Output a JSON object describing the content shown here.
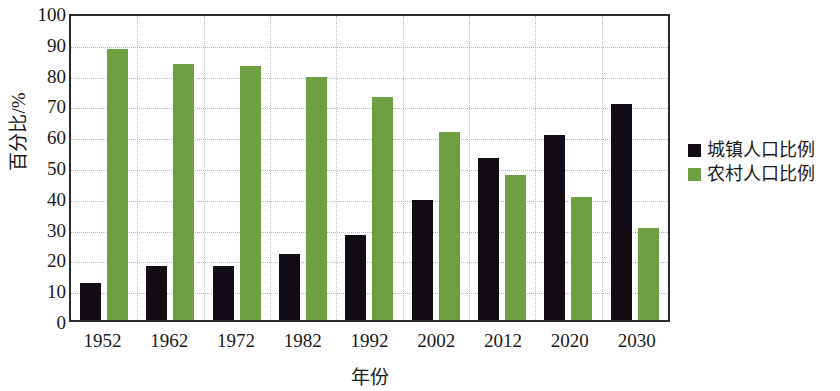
{
  "chart_data": {
    "type": "bar",
    "title": "",
    "xlabel": "年份",
    "ylabel": "百分比/%",
    "ylim": [
      0,
      100
    ],
    "ytick_step": 10,
    "yticks": [
      100,
      90,
      80,
      70,
      60,
      50,
      40,
      30,
      20,
      10,
      0
    ],
    "grid": true,
    "legend_position": "right",
    "categories": [
      "1952",
      "1962",
      "1972",
      "1982",
      "1992",
      "2002",
      "2012",
      "2020",
      "2030"
    ],
    "series": [
      {
        "name": "城镇人口比例",
        "color": "#120d14",
        "values": [
          12,
          17.5,
          17.5,
          21.5,
          27.5,
          39,
          52.5,
          60,
          70
        ]
      },
      {
        "name": "农村人口比例",
        "color": "#6ea042",
        "values": [
          88,
          83,
          82.5,
          79,
          72.5,
          61,
          47,
          40,
          30
        ]
      }
    ]
  },
  "legend": {
    "items": [
      {
        "label": "城镇人口比例",
        "swatch": "#120d14"
      },
      {
        "label": "农村人口比例",
        "swatch": "#6ea042"
      }
    ]
  }
}
